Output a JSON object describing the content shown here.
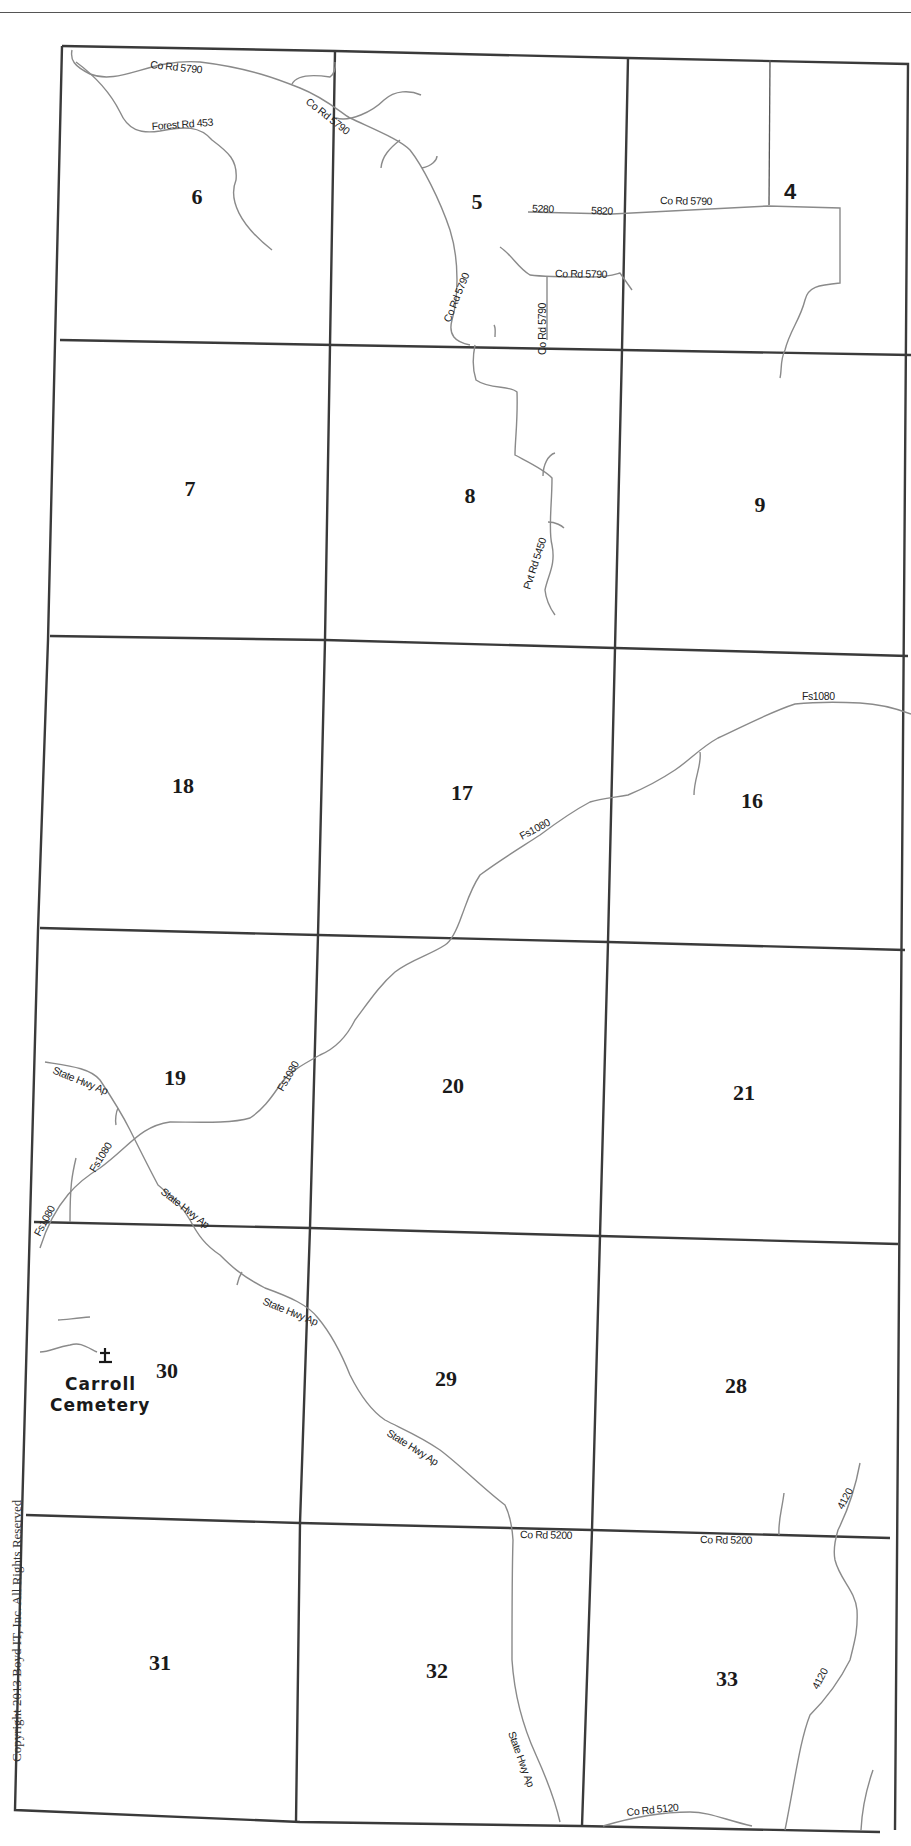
{
  "map": {
    "type": "township section map",
    "sections": [
      {
        "label": "6",
        "x": 197,
        "y": 204
      },
      {
        "label": "5",
        "x": 477,
        "y": 209
      },
      {
        "label": "4",
        "x": 790,
        "y": 199
      },
      {
        "label": "7",
        "x": 190,
        "y": 496
      },
      {
        "label": "8",
        "x": 470,
        "y": 503
      },
      {
        "label": "9",
        "x": 760,
        "y": 512
      },
      {
        "label": "18",
        "x": 183,
        "y": 793
      },
      {
        "label": "17",
        "x": 462,
        "y": 800
      },
      {
        "label": "16",
        "x": 752,
        "y": 808
      },
      {
        "label": "19",
        "x": 175,
        "y": 1085
      },
      {
        "label": "20",
        "x": 453,
        "y": 1093
      },
      {
        "label": "21",
        "x": 744,
        "y": 1100
      },
      {
        "label": "30",
        "x": 167,
        "y": 1378
      },
      {
        "label": "29",
        "x": 446,
        "y": 1386
      },
      {
        "label": "28",
        "x": 736,
        "y": 1393
      },
      {
        "label": "31",
        "x": 160,
        "y": 1670
      },
      {
        "label": "32",
        "x": 437,
        "y": 1678
      },
      {
        "label": "33",
        "x": 727,
        "y": 1686
      }
    ],
    "road_labels": [
      {
        "text": "Co Rd 5790",
        "x": 150,
        "y": 68,
        "rotate": 6
      },
      {
        "text": "Forest Rd 453",
        "x": 152,
        "y": 130,
        "rotate": -4
      },
      {
        "text": "Co Rd 5790",
        "x": 305,
        "y": 103,
        "rotate": 38
      },
      {
        "text": "5280",
        "x": 532,
        "y": 212,
        "rotate": 2
      },
      {
        "text": "5820",
        "x": 591,
        "y": 214,
        "rotate": 2
      },
      {
        "text": "Co Rd 5790",
        "x": 660,
        "y": 204,
        "rotate": 1
      },
      {
        "text": "Co Rd 5790",
        "x": 555,
        "y": 277,
        "rotate": 1
      },
      {
        "text": "Co Rd 5790",
        "x": 450,
        "y": 323,
        "rotate": -68
      },
      {
        "text": "Co Rd 5790",
        "x": 546,
        "y": 355,
        "rotate": -90
      },
      {
        "text": "Pvt Rd 5450",
        "x": 530,
        "y": 590,
        "rotate": -72
      },
      {
        "text": "Fs1080",
        "x": 802,
        "y": 700,
        "rotate": 0
      },
      {
        "text": "Fs1080",
        "x": 522,
        "y": 840,
        "rotate": -28
      },
      {
        "text": "Fs1080",
        "x": 283,
        "y": 1092,
        "rotate": -60
      },
      {
        "text": "State Hwy Ap",
        "x": 52,
        "y": 1073,
        "rotate": 22
      },
      {
        "text": "Fs1080",
        "x": 95,
        "y": 1173,
        "rotate": -58
      },
      {
        "text": "State Hwy Ap",
        "x": 160,
        "y": 1193,
        "rotate": 38
      },
      {
        "text": "Fs1080",
        "x": 40,
        "y": 1237,
        "rotate": -62
      },
      {
        "text": "State Hwy Ap",
        "x": 262,
        "y": 1304,
        "rotate": 22
      },
      {
        "text": "State Hwy Ap",
        "x": 386,
        "y": 1435,
        "rotate": 32
      },
      {
        "text": "Co Rd 5200",
        "x": 520,
        "y": 1538,
        "rotate": 1
      },
      {
        "text": "Co Rd 5200",
        "x": 700,
        "y": 1543,
        "rotate": 1
      },
      {
        "text": "4120",
        "x": 843,
        "y": 1510,
        "rotate": -62
      },
      {
        "text": "4120",
        "x": 818,
        "y": 1690,
        "rotate": -62
      },
      {
        "text": "State Hwy Ap",
        "x": 508,
        "y": 1733,
        "rotate": 70
      },
      {
        "text": "Co Rd 5120",
        "x": 627,
        "y": 1816,
        "rotate": -6
      }
    ],
    "landmark": {
      "name_line1": "Carroll",
      "name_line2": "Cemetery",
      "symbol": "cemetery-cross",
      "glyph": "±"
    },
    "copyright": "Copyright 2013 Boyd IT, Inc. All Rights Reserved"
  }
}
